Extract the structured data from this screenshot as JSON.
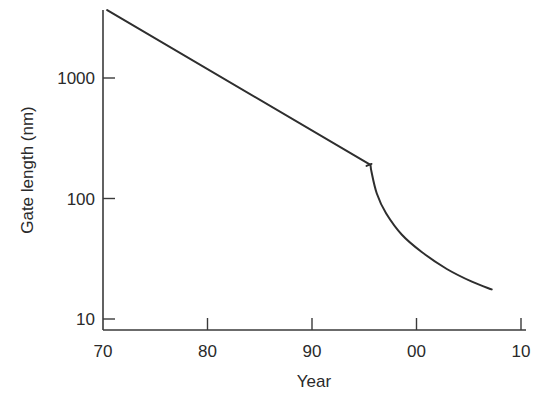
{
  "chart_data": {
    "type": "line",
    "title": "",
    "xlabel": "Year",
    "ylabel": "Gate length (nm)",
    "yscale": "log",
    "xlim": [
      70,
      111
    ],
    "ylim": [
      8,
      4000
    ],
    "grid": false,
    "legend": "none",
    "x_ticks": [
      {
        "value": 70,
        "label": "70"
      },
      {
        "value": 80,
        "label": "80"
      },
      {
        "value": 90,
        "label": "90"
      },
      {
        "value": 100,
        "label": "00"
      },
      {
        "value": 110,
        "label": "10"
      }
    ],
    "y_ticks": [
      {
        "value": 10,
        "label": "10"
      },
      {
        "value": 100,
        "label": "100"
      },
      {
        "value": 1000,
        "label": "1000"
      }
    ],
    "series": [
      {
        "name": "gate-length-trend",
        "color": "#2e2e2e",
        "points": [
          {
            "x": 70.4,
            "y": 3660
          },
          {
            "x": 95.6,
            "y": 190
          },
          {
            "x": 95.7,
            "y": 165
          },
          {
            "x": 96.2,
            "y": 110
          },
          {
            "x": 97.1,
            "y": 75
          },
          {
            "x": 98.6,
            "y": 50
          },
          {
            "x": 100.5,
            "y": 36
          },
          {
            "x": 102.9,
            "y": 26
          },
          {
            "x": 105.3,
            "y": 20.4
          },
          {
            "x": 107.2,
            "y": 17.6
          }
        ]
      }
    ]
  }
}
